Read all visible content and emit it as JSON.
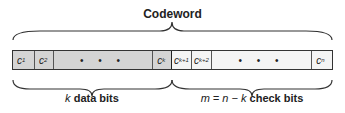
{
  "title": "Codeword",
  "cells": [
    {
      "name": "c",
      "sub": "1",
      "type": "data"
    },
    {
      "name": "c",
      "sub": "2",
      "type": "data"
    },
    {
      "name": "• • •",
      "sub": "",
      "type": "data-dots"
    },
    {
      "name": "c",
      "sub": "k",
      "type": "data"
    },
    {
      "name": "c",
      "sub": "k+1",
      "type": "check"
    },
    {
      "name": "c",
      "sub": "k+2",
      "type": "check"
    },
    {
      "name": "• • •",
      "sub": "",
      "type": "check-dots"
    },
    {
      "name": "c",
      "sub": "n",
      "type": "check"
    }
  ],
  "labels": {
    "data_var": "k",
    "data_text": "data bits",
    "check_var": "m = n − k",
    "check_text": "check bits"
  },
  "colors": {
    "data_fill": "#d4d4d4",
    "check_fill": "#f4f4f4",
    "stroke": "#333333"
  }
}
